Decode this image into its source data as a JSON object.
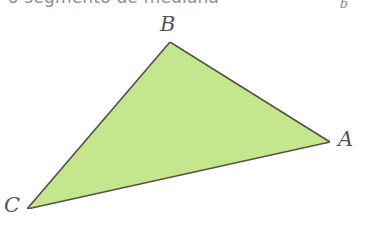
{
  "figure": {
    "background_color": "#ffffff",
    "width": 366,
    "height": 225,
    "caption": {
      "text": "o segmento de mediana",
      "subscript": "b",
      "color": "#8d8d8d",
      "cropped": "true"
    },
    "shape": {
      "kind": "triangle",
      "name": "triangle-ABC",
      "fill_color": "#c5e88a",
      "stroke_color": "#4a4a3e",
      "stroke_width": 1.6,
      "points": "170,42 330,142 27,209",
      "vertices": [
        {
          "id": "B",
          "label": "B",
          "x": 170,
          "y": 42
        },
        {
          "id": "A",
          "label": "A",
          "x": 330,
          "y": 142
        },
        {
          "id": "C",
          "label": "C",
          "x": 27,
          "y": 209
        }
      ]
    }
  }
}
